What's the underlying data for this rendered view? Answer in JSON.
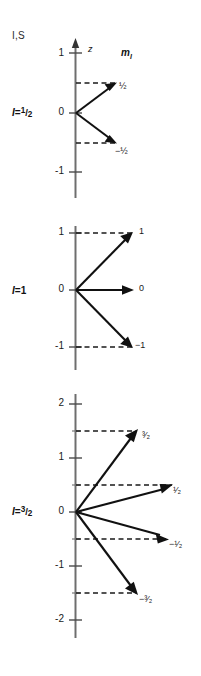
{
  "figure": {
    "corner_label": "I,S",
    "axis_title": "z",
    "quantum_number_title": "m",
    "quantum_number_subscript": "I",
    "width": 201,
    "height": 676,
    "colors": {
      "axis": "#6e6e6e",
      "vector": "#111111",
      "dashed": "#1a1a1a",
      "text": "#1a1a1a",
      "background": "#ffffff"
    }
  },
  "panels": [
    {
      "id": "panel-spin-half",
      "label_prefix": "I",
      "label_equals": "=",
      "label_value_num": "1",
      "label_value_slash": "/",
      "label_value_den": "2",
      "label_text": "I=1/2",
      "show_axis_arrow": true,
      "axis_ticks": [
        "1",
        "0",
        "-1"
      ],
      "axis_tick_values": [
        1,
        0,
        -1
      ],
      "ylim": [
        -1.35,
        1.35
      ],
      "vectors": [
        {
          "mi": 0.5,
          "label": "1/2",
          "label_display": "½",
          "sign": ""
        },
        {
          "mi": -0.5,
          "label": "-1/2",
          "label_display": "−½",
          "sign": "−"
        }
      ]
    },
    {
      "id": "panel-spin-one",
      "label_prefix": "I",
      "label_equals": "=",
      "label_value_num": "",
      "label_value_slash": "",
      "label_value_den": "",
      "label_text": "I=1",
      "label_plain": "1",
      "show_axis_arrow": false,
      "axis_ticks": [
        "1",
        "0",
        "-1"
      ],
      "axis_tick_values": [
        1,
        0,
        -1
      ],
      "ylim": [
        -1.35,
        1.35
      ],
      "vectors": [
        {
          "mi": 1,
          "label": "1",
          "label_display": "1",
          "sign": ""
        },
        {
          "mi": 0,
          "label": "0",
          "label_display": "0",
          "sign": ""
        },
        {
          "mi": -1,
          "label": "-1",
          "label_display": "−1",
          "sign": "−"
        }
      ]
    },
    {
      "id": "panel-spin-three-halves",
      "label_prefix": "I",
      "label_equals": "=",
      "label_value_num": "3",
      "label_value_slash": "/",
      "label_value_den": "2",
      "label_text": "I=3/2",
      "show_axis_arrow": false,
      "axis_ticks": [
        "2",
        "1",
        "0",
        "-1",
        "-2"
      ],
      "axis_tick_values": [
        2,
        1,
        0,
        -1,
        -2
      ],
      "ylim": [
        -2.3,
        2.3
      ],
      "vectors": [
        {
          "mi": 1.5,
          "label": "3/2",
          "label_display": "³⁄₂",
          "sign": ""
        },
        {
          "mi": 0.5,
          "label": "1/2",
          "label_display": "¹⁄₂",
          "sign": ""
        },
        {
          "mi": -0.5,
          "label": "-1/2",
          "label_display": "−¹⁄₂",
          "sign": "−"
        },
        {
          "mi": -1.5,
          "label": "-3/2",
          "label_display": "−³⁄₂",
          "sign": "−"
        }
      ]
    }
  ]
}
